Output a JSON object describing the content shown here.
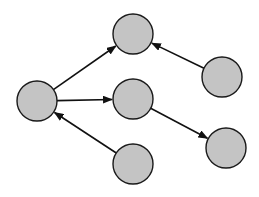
{
  "diagram": {
    "type": "directed-graph",
    "node_fill": "#c4c4c4",
    "node_stroke": "#1a1a1a",
    "edge_color": "#111111",
    "node_radius": 20,
    "nodes": [
      {
        "id": "left",
        "cx": 37,
        "cy": 101
      },
      {
        "id": "top",
        "cx": 133,
        "cy": 34
      },
      {
        "id": "middle",
        "cx": 133,
        "cy": 99
      },
      {
        "id": "right-top",
        "cx": 222,
        "cy": 77
      },
      {
        "id": "right-bottom",
        "cx": 226,
        "cy": 148
      },
      {
        "id": "bottom",
        "cx": 133,
        "cy": 164
      }
    ],
    "edges": [
      {
        "from": "left",
        "to": "top"
      },
      {
        "from": "left",
        "to": "middle"
      },
      {
        "from": "right-top",
        "to": "top"
      },
      {
        "from": "middle",
        "to": "right-bottom"
      },
      {
        "from": "bottom",
        "to": "left"
      }
    ]
  }
}
